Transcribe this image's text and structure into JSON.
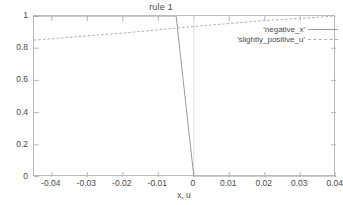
{
  "chart_data": {
    "type": "line",
    "title": "rule 1",
    "xlabel": "x, u",
    "ylabel": "",
    "xlim": [
      -0.045,
      0.04
    ],
    "ylim": [
      0,
      1
    ],
    "grid": false,
    "legend_position": "top-right-inside",
    "xticks": [
      -0.04,
      -0.03,
      -0.02,
      -0.01,
      0,
      0.01,
      0.02,
      0.03,
      0.04
    ],
    "xtick_labels": [
      "-0.04",
      "-0.03",
      "-0.02",
      "-0.01",
      "0",
      "0.01",
      "0.02",
      "0.03",
      "0.04"
    ],
    "yticks": [
      0,
      0.2,
      0.4,
      0.6,
      0.8,
      1
    ],
    "ytick_labels": [
      "0",
      "0.2",
      "0.4",
      "0.6",
      "0.8",
      "1"
    ],
    "series": [
      {
        "name": "'negative_x'",
        "style": "solid",
        "color": "#9a9a9a",
        "x": [
          -0.045,
          -0.005,
          0.0,
          0.04
        ],
        "y": [
          1.0,
          1.0,
          0.0,
          0.0
        ]
      },
      {
        "name": "'slightly_positive_u'",
        "style": "dashed",
        "color": "#b0b0b0",
        "x": [
          -0.045,
          -0.02,
          0.0,
          0.02,
          0.04
        ],
        "y": [
          0.85,
          0.894,
          0.935,
          0.972,
          1.0
        ]
      }
    ]
  },
  "legend": {
    "entries": [
      {
        "label": "'negative_x'"
      },
      {
        "label": "'slightly_positive_u'"
      }
    ]
  }
}
